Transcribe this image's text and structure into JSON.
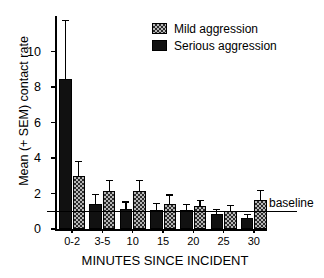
{
  "chart_data": {
    "type": "bar",
    "title": "",
    "subtitle": "",
    "xlabel": "MINUTES SINCE INCIDENT",
    "ylabel": "Mean (+ SEM) contact rate",
    "categories": [
      "0-2",
      "3-5",
      "10",
      "15",
      "20",
      "25",
      "30"
    ],
    "ylim": [
      0,
      12
    ],
    "yticks": [
      0,
      2,
      4,
      6,
      8,
      10
    ],
    "ytick_labels": [
      "0",
      "2",
      "4",
      "6",
      "8",
      "10"
    ],
    "grid": false,
    "legend_position": "top-right",
    "series": [
      {
        "name": "Serious aggression",
        "key": "serious",
        "color": "#111111",
        "pattern": "solid",
        "values": [
          8.45,
          1.4,
          1.1,
          1.05,
          1.05,
          0.85,
          0.6
        ],
        "errors": [
          3.35,
          0.6,
          0.45,
          0.4,
          0.35,
          0.3,
          0.25
        ]
      },
      {
        "name": "Mild aggression",
        "key": "mild",
        "color": "#b7b7b7",
        "pattern": "hatched",
        "values": [
          3.0,
          2.15,
          2.15,
          1.4,
          1.3,
          1.0,
          1.65
        ],
        "errors": [
          0.85,
          0.6,
          0.6,
          0.55,
          0.35,
          0.35,
          0.55
        ]
      }
    ],
    "annotations": [
      {
        "name": "baseline",
        "label": "baseline",
        "value": 1.0,
        "orientation": "horizontal"
      }
    ]
  },
  "legend": {
    "items": [
      {
        "label": "Mild aggression",
        "key": "mild"
      },
      {
        "label": "Serious aggression",
        "key": "serious"
      }
    ]
  }
}
